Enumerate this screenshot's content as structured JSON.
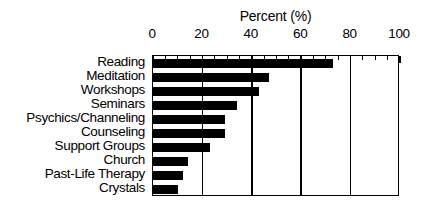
{
  "chart_data": {
    "type": "bar",
    "orientation": "horizontal",
    "title": "",
    "xlabel": "Percent (%)",
    "ylabel": "",
    "xlim": [
      0,
      100
    ],
    "xticks": [
      0,
      20,
      40,
      60,
      80,
      100
    ],
    "xtick_labels": [
      "0",
      "20",
      "40",
      "60",
      "80",
      "100"
    ],
    "minor_tick_interval": 5,
    "grid": "vertical-major",
    "legend": "none",
    "bar_color": "#000000",
    "background_color": "#ffffff",
    "categories": [
      "Reading",
      "Meditation",
      "Workshops",
      "Seminars",
      "Psychics/Channeling",
      "Counseling",
      "Support Groups",
      "Church",
      "Past-Life Therapy",
      "Crystals"
    ],
    "values": [
      73,
      47,
      43,
      34,
      29,
      29,
      23,
      14,
      12,
      10
    ]
  }
}
